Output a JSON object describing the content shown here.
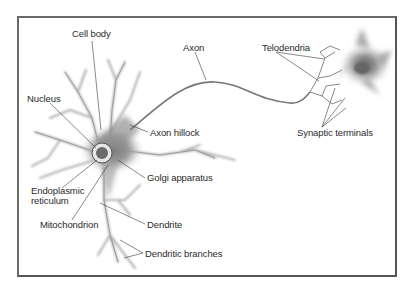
{
  "diagram": {
    "frame_color": "#666666",
    "cell_color": "#8a8a8a",
    "labels": {
      "cell_body": "Cell body",
      "axon": "Axon",
      "telodendria": "Telodendria",
      "nucleus": "Nucleus",
      "axon_hillock": "Axon hillock",
      "synaptic_terminals": "Synaptic terminals",
      "golgi_apparatus": "Golgi apparatus",
      "endoplasmic_reticulum_line1": "Endoplasmic",
      "endoplasmic_reticulum_line2": "reticulum",
      "mitochondrion": "Mitochondrion",
      "dendrite": "Dendrite",
      "dendritic_branches": "Dendritic branches"
    }
  }
}
